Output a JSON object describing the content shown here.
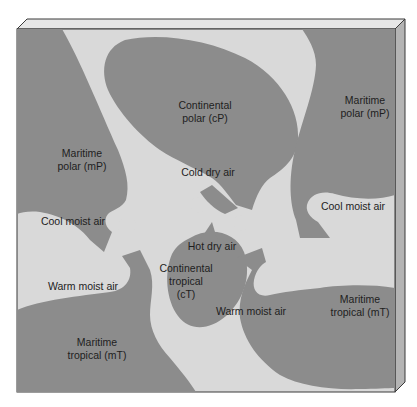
{
  "colors": {
    "air_mass": "#8c8c8c",
    "background": "#d9d9d9",
    "box_top": "#e6e6e6",
    "box_side": "#b4b4b4",
    "outline": "#3a3a3a",
    "text": "#1e1e1e"
  },
  "air_masses": [
    {
      "id": "mP-west",
      "line1": "Maritime",
      "line2": "polar (mP)"
    },
    {
      "id": "cP",
      "line1": "Continental",
      "line2": "polar (cP)"
    },
    {
      "id": "mP-east",
      "line1": "Maritime",
      "line2": "polar (mP)"
    },
    {
      "id": "cT",
      "line1": "Continental",
      "line2": "tropical",
      "line3": "(cT)"
    },
    {
      "id": "mT-west",
      "line1": "Maritime",
      "line2": "tropical (mT)"
    },
    {
      "id": "mT-east",
      "line1": "Maritime",
      "line2": "tropical (mT)"
    }
  ],
  "flows": [
    {
      "id": "cold-dry",
      "label": "Cold dry air"
    },
    {
      "id": "cool-moist-west",
      "label": "Cool moist air"
    },
    {
      "id": "cool-moist-east",
      "label": "Cool moist air"
    },
    {
      "id": "hot-dry",
      "label": "Hot dry air"
    },
    {
      "id": "warm-moist-west",
      "label": "Warm moist air"
    },
    {
      "id": "warm-moist-east",
      "label": "Warm moist air"
    }
  ]
}
